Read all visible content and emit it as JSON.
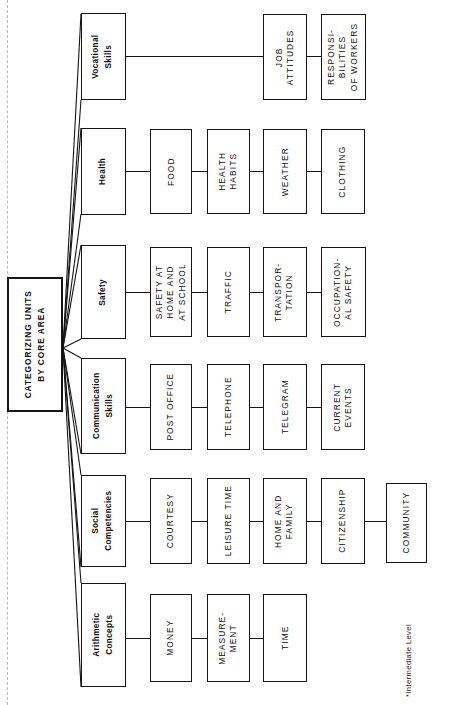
{
  "diagram": {
    "orientation": "rotated-90-landscape-chart-on-portrait-page",
    "root": {
      "label": "CATEGORIZING UNITS\nBY CORE AREA"
    },
    "footnote": "*Intermediate Level",
    "branches": [
      {
        "category": "Vocational\nSkills",
        "units": [
          "JOB\nATTITUDES",
          "RESPONSI-\nBILITIES\nOF WORKERS"
        ]
      },
      {
        "category": "Health",
        "units": [
          "FOOD",
          "HEALTH\nHABITS",
          "WEATHER",
          "CLOTHING"
        ]
      },
      {
        "category": "Safety",
        "units": [
          "SAFETY AT\nHOME AND\nAT SCHOOL",
          "TRAFFIC",
          "TRANSPOR-\nTATION",
          "OCCUPATION-\nAL SAFETY"
        ]
      },
      {
        "category": "Communication\nSkills",
        "units": [
          "POST OFFICE",
          "TELEPHONE",
          "TELEGRAM",
          "CURRENT\nEVENTS"
        ]
      },
      {
        "category": "Social\nCompetencies",
        "units": [
          "COURTESY",
          "LEISURE TIME",
          "HOME AND\nFAMILY",
          "CITIZENSHIP",
          "COMMUNITY"
        ]
      },
      {
        "category": "Arithmetic\nConcepts",
        "units": [
          "MONEY",
          "MEASURE-\nMENT",
          "TIME"
        ]
      }
    ]
  },
  "colors": {
    "ink": "#151515",
    "paper": "#ffffff",
    "fold": "#b9b9b9"
  }
}
